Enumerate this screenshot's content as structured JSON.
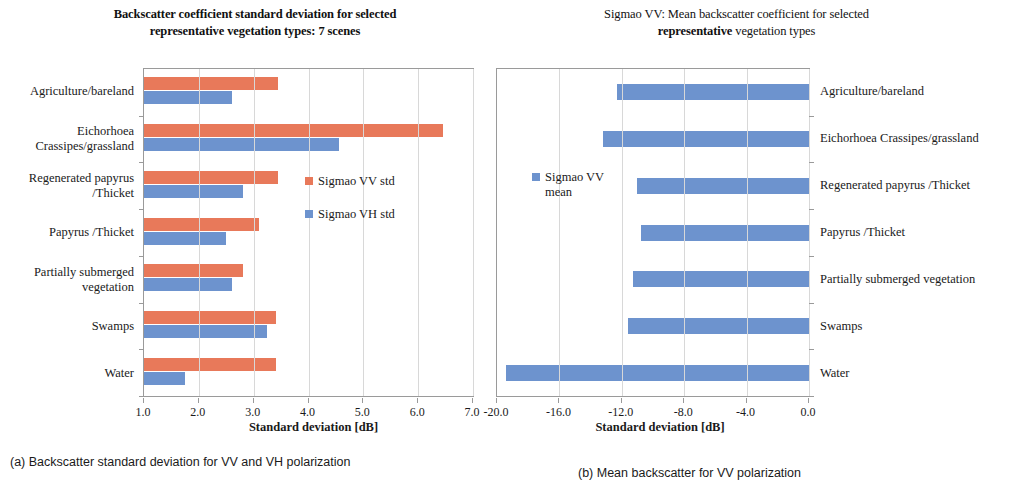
{
  "figure": {
    "panel_a": {
      "title_line1": "Backscatter coefficient standard deviation for selected",
      "title_line2": "representative vegetation types: 7 scenes",
      "caption": "(a) Backscatter standard deviation for VV and VH polarization",
      "legend": [
        {
          "label": "Sigmao VV std",
          "color": "#E8795A",
          "key": "vv"
        },
        {
          "label": "Sigmao VH std",
          "color": "#6D93CE",
          "key": "vh"
        }
      ]
    },
    "panel_b": {
      "title_line1": "Sigmao VV: Mean backscatter coefficient for selected",
      "title_line2_bold": "representative",
      "title_line2_rest": " vegetation types",
      "caption": "(b) Mean backscatter for VV polarization",
      "legend": [
        {
          "label": "Sigmao VV\nmean",
          "color": "#6D93CE",
          "key": "mean"
        }
      ]
    }
  },
  "chart_data": [
    {
      "id": "panel-a",
      "type": "bar",
      "orientation": "horizontal",
      "title": "Backscatter coefficient standard deviation for selected representative vegetation types: 7 scenes",
      "xlabel": "Standard deviation [dB]",
      "ylabel": "",
      "xlim": [
        1.0,
        7.0
      ],
      "xticks": [
        "1.0",
        "2.0",
        "3.0",
        "4.0",
        "5.0",
        "6.0",
        "7.0"
      ],
      "xtick_values": [
        1.0,
        2.0,
        3.0,
        4.0,
        5.0,
        6.0,
        7.0
      ],
      "grid": true,
      "legend_position": "inside-right",
      "categories": [
        "Agriculture/bareland",
        "Eichorhoea\nCrassipes/grassland",
        "Regenerated papyrus\n/Thicket",
        "Papyrus /Thicket",
        "Partially submerged\nvegetation",
        "Swamps",
        "Water"
      ],
      "series": [
        {
          "name": "Sigmao VV std",
          "color": "#E8795A",
          "values": [
            3.45,
            6.45,
            3.45,
            3.1,
            2.8,
            3.4,
            3.4
          ]
        },
        {
          "name": "Sigmao VH std",
          "color": "#6D93CE",
          "values": [
            2.6,
            4.55,
            2.8,
            2.5,
            2.6,
            3.25,
            1.75
          ]
        }
      ]
    },
    {
      "id": "panel-b",
      "type": "bar",
      "orientation": "horizontal",
      "title": "Sigmao VV: Mean backscatter coefficient for selected representative vegetation types",
      "xlabel": "Standard deviation [dB]",
      "ylabel": "",
      "xlim": [
        -20.0,
        0.0
      ],
      "xticks": [
        "-20.0",
        "-16.0",
        "-12.0",
        "-8.0",
        "-4.0",
        "0.0"
      ],
      "xtick_values": [
        -20.0,
        -16.0,
        -12.0,
        -8.0,
        -4.0,
        0.0
      ],
      "grid": true,
      "legend_position": "inside-left",
      "categories": [
        "Agriculture/bareland",
        "Eichorhoea Crassipes/grassland",
        "Regenerated papyrus /Thicket",
        "Papyrus /Thicket",
        "Partially submerged vegetation",
        "Swamps",
        "Water"
      ],
      "series": [
        {
          "name": "Sigmao VV mean",
          "color": "#6D93CE",
          "values": [
            -12.3,
            -13.2,
            -11.0,
            -10.8,
            -11.3,
            -11.6,
            -19.4
          ]
        }
      ]
    }
  ]
}
